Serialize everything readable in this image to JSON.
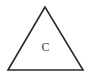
{
  "diagram": {
    "shape": "triangle",
    "vertices": [
      [
        45,
        7
      ],
      [
        8,
        70
      ],
      [
        83,
        70
      ]
    ],
    "stroke_color": "#2a2a2a",
    "stroke_width": 1.6,
    "fill": "#ffffff",
    "label": "C",
    "label_color": "#333333"
  }
}
